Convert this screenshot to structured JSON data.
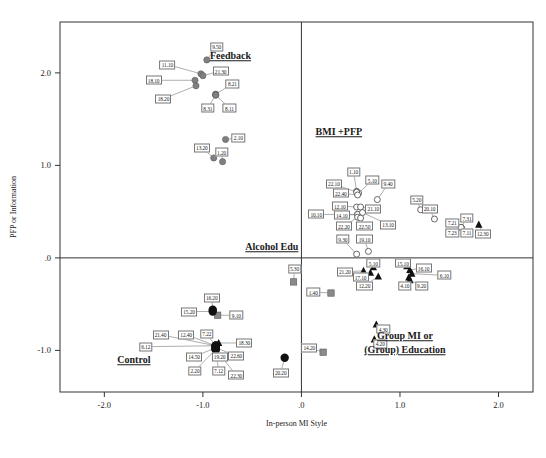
{
  "chart_data": {
    "type": "scatter",
    "title": "",
    "xlabel": "In-person MI Style",
    "ylabel": "PFP or Information",
    "xlim": [
      -2.45,
      2.35
    ],
    "ylim": [
      -1.45,
      2.55
    ],
    "xticks": [
      "-2.0",
      "-1.0",
      ".0",
      "1.0",
      "2.0"
    ],
    "xtickvals": [
      -2.0,
      -1.0,
      0.0,
      1.0,
      2.0
    ],
    "yticks": [
      "2.0",
      "1.0",
      ".0",
      "-1.0"
    ],
    "ytickvals": [
      2.0,
      1.0,
      0.0,
      -1.0
    ],
    "grid": false,
    "legend": "none",
    "reference_lines": {
      "vertical_x": 0.0,
      "horizontal_y": 0.0
    },
    "group_annotations": [
      {
        "text": "Feedback",
        "x": -0.72,
        "y": 2.18
      },
      {
        "text": "BMI +PFP",
        "x": 0.38,
        "y": 1.36
      },
      {
        "text": "Alcohol Edu",
        "x": -0.3,
        "y": 0.12
      },
      {
        "text": "Control",
        "x": -1.7,
        "y": -1.1
      },
      {
        "text": "Group MI or",
        "x": 1.05,
        "y": -0.84
      },
      {
        "text": "(Group) Education",
        "x": 1.05,
        "y": -1.0
      }
    ],
    "series": [
      {
        "name": "Feedback",
        "marker": "filled-circle-gray",
        "color": "#808080",
        "points": [
          {
            "label": "9.50",
            "x": -0.96,
            "y": 2.14,
            "lx": -0.86,
            "ly": 2.28
          },
          {
            "label": "11.10",
            "x": -1.02,
            "y": 1.99,
            "lx": -1.36,
            "ly": 2.09
          },
          {
            "label": "21.30",
            "x": -1.0,
            "y": 1.97,
            "lx": -0.82,
            "ly": 2.02
          },
          {
            "label": "18.10",
            "x": -1.08,
            "y": 1.92,
            "lx": -1.5,
            "ly": 1.92
          },
          {
            "label": "18.20",
            "x": -1.07,
            "y": 1.86,
            "lx": -1.4,
            "ly": 1.72
          },
          {
            "label": "8.21",
            "x": -0.87,
            "y": 1.77,
            "lx": -0.7,
            "ly": 1.88
          },
          {
            "label": "8.31",
            "x": -0.87,
            "y": 1.76,
            "lx": -0.95,
            "ly": 1.62
          },
          {
            "label": "8.11",
            "x": -0.87,
            "y": 1.76,
            "lx": -0.73,
            "ly": 1.62
          },
          {
            "label": "2.10",
            "x": -0.77,
            "y": 1.28,
            "lx": -0.64,
            "ly": 1.3
          },
          {
            "label": "13.20",
            "x": -0.89,
            "y": 1.08,
            "lx": -1.01,
            "ly": 1.19
          },
          {
            "label": "1.20",
            "x": -0.8,
            "y": 1.04,
            "lx": -0.81,
            "ly": 1.14
          }
        ]
      },
      {
        "name": "BMI +PFP",
        "marker": "open-circle",
        "color": "#555555",
        "points": [
          {
            "label": "1.10",
            "x": 0.56,
            "y": 0.72,
            "lx": 0.53,
            "ly": 0.93
          },
          {
            "label": "5.10",
            "x": 0.58,
            "y": 0.7,
            "lx": 0.72,
            "ly": 0.84
          },
          {
            "label": "9.40",
            "x": 0.77,
            "y": 0.63,
            "lx": 0.88,
            "ly": 0.8
          },
          {
            "label": "22.10",
            "x": 0.56,
            "y": 0.71,
            "lx": 0.33,
            "ly": 0.8
          },
          {
            "label": "22.40",
            "x": 0.57,
            "y": 0.68,
            "lx": 0.4,
            "ly": 0.7
          },
          {
            "label": "5.20",
            "x": 1.21,
            "y": 0.52,
            "lx": 1.17,
            "ly": 0.63
          },
          {
            "label": "12.10",
            "x": 0.56,
            "y": 0.55,
            "lx": 0.39,
            "ly": 0.56
          },
          {
            "label": "21.10",
            "x": 0.6,
            "y": 0.55,
            "lx": 0.73,
            "ly": 0.53
          },
          {
            "label": "20.10",
            "x": 1.35,
            "y": 0.42,
            "lx": 1.3,
            "ly": 0.53
          },
          {
            "label": "14.10",
            "x": 0.57,
            "y": 0.47,
            "lx": 0.41,
            "ly": 0.46
          },
          {
            "label": "10.10",
            "x": 0.57,
            "y": 0.47,
            "lx": 0.15,
            "ly": 0.47
          },
          {
            "label": "13.10",
            "x": 0.62,
            "y": 0.49,
            "lx": 0.88,
            "ly": 0.36
          },
          {
            "label": "22.20",
            "x": 0.57,
            "y": 0.44,
            "lx": 0.43,
            "ly": 0.34
          },
          {
            "label": "22.50",
            "x": 0.6,
            "y": 0.43,
            "lx": 0.64,
            "ly": 0.34
          },
          {
            "label": "7.31",
            "x": 1.62,
            "y": 0.33,
            "lx": 1.68,
            "ly": 0.43
          },
          {
            "label": "7.21",
            "x": 1.62,
            "y": 0.33,
            "lx": 1.53,
            "ly": 0.38
          },
          {
            "label": "7.23",
            "x": 1.62,
            "y": 0.33,
            "lx": 1.53,
            "ly": 0.27
          },
          {
            "label": "7.11",
            "x": 1.62,
            "y": 0.33,
            "lx": 1.68,
            "ly": 0.27
          },
          {
            "label": "9.30",
            "x": 0.56,
            "y": 0.04,
            "lx": 0.42,
            "ly": 0.2
          },
          {
            "label": "19.10",
            "x": 0.68,
            "y": 0.07,
            "lx": 0.64,
            "ly": 0.2
          }
        ]
      },
      {
        "name": "Group MI or (Group) Education",
        "marker": "filled-triangle",
        "color": "#111111",
        "points": [
          {
            "label": "12.30",
            "x": 1.8,
            "y": 0.36,
            "lx": 1.84,
            "ly": 0.26
          },
          {
            "label": "5.10b",
            "display": "5.10",
            "x": 0.73,
            "y": -0.1,
            "lx": 0.73,
            "ly": -0.06
          },
          {
            "label": "21.20",
            "x": 0.63,
            "y": -0.14,
            "lx": 0.44,
            "ly": -0.15
          },
          {
            "label": "17.10",
            "x": 0.7,
            "y": -0.16,
            "lx": 0.6,
            "ly": -0.21
          },
          {
            "label": "12.20",
            "x": 0.78,
            "y": -0.2,
            "lx": 0.64,
            "ly": -0.3
          },
          {
            "label": "15.10",
            "x": 1.07,
            "y": -0.09,
            "lx": 1.03,
            "ly": -0.06
          },
          {
            "label": "16.10",
            "x": 1.1,
            "y": -0.13,
            "lx": 1.24,
            "ly": -0.11
          },
          {
            "label": "6.10",
            "x": 1.12,
            "y": -0.17,
            "lx": 1.45,
            "ly": -0.19
          },
          {
            "label": "4.10",
            "x": 1.09,
            "y": -0.21,
            "lx": 1.05,
            "ly": -0.3
          },
          {
            "label": "9.20",
            "x": 1.1,
            "y": -0.24,
            "lx": 1.22,
            "ly": -0.3
          },
          {
            "label": "4.30",
            "x": 0.76,
            "y": -0.72,
            "lx": 0.83,
            "ly": -0.77
          },
          {
            "label": "4.20",
            "x": 0.74,
            "y": -0.88,
            "lx": 0.8,
            "ly": -0.93
          },
          {
            "label": "18.30",
            "x": -0.84,
            "y": -0.92,
            "lx": -0.58,
            "ly": -0.92
          }
        ]
      },
      {
        "name": "Alcohol Edu",
        "marker": "filled-square-gray",
        "color": "#8a8a8a",
        "points": [
          {
            "label": "5.30",
            "x": -0.08,
            "y": -0.26,
            "lx": -0.07,
            "ly": -0.12
          },
          {
            "label": "1.40",
            "x": 0.3,
            "y": -0.38,
            "lx": 0.12,
            "ly": -0.37
          },
          {
            "label": "9.10",
            "x": -0.85,
            "y": -0.62,
            "lx": -0.66,
            "ly": -0.62
          },
          {
            "label": "14.20",
            "x": 0.22,
            "y": -1.02,
            "lx": 0.08,
            "ly": -0.97
          }
        ]
      },
      {
        "name": "Control",
        "marker": "filled-circle-black",
        "color": "#111111",
        "points": [
          {
            "label": "16.20",
            "x": -0.9,
            "y": -0.56,
            "lx": -0.91,
            "ly": -0.43
          },
          {
            "label": "15.20",
            "x": -0.9,
            "y": -0.58,
            "lx": -1.14,
            "ly": -0.58
          },
          {
            "label": "7.22",
            "x": -0.87,
            "y": -0.95,
            "lx": -0.96,
            "ly": -0.82
          },
          {
            "label": "21.40",
            "x": -0.87,
            "y": -0.95,
            "lx": -1.43,
            "ly": -0.83
          },
          {
            "label": "12.40",
            "x": -0.87,
            "y": -0.95,
            "lx": -1.17,
            "ly": -0.83
          },
          {
            "label": "6.12",
            "x": -0.87,
            "y": -0.95,
            "lx": -1.58,
            "ly": -0.96
          },
          {
            "label": "14.50",
            "x": -0.87,
            "y": -0.97,
            "lx": -1.09,
            "ly": -1.07
          },
          {
            "label": "19.20",
            "x": -0.87,
            "y": -0.97,
            "lx": -0.83,
            "ly": -1.07
          },
          {
            "label": "22.60",
            "x": -0.87,
            "y": -0.97,
            "lx": -0.66,
            "ly": -1.06
          },
          {
            "label": "2.20",
            "x": -0.87,
            "y": -0.99,
            "lx": -1.08,
            "ly": -1.22
          },
          {
            "label": "7.12",
            "x": -0.87,
            "y": -0.99,
            "lx": -0.84,
            "ly": -1.22
          },
          {
            "label": "22.30",
            "x": -0.87,
            "y": -0.99,
            "lx": -0.66,
            "ly": -1.27
          },
          {
            "label": "20.20",
            "x": -0.17,
            "y": -1.08,
            "lx": -0.21,
            "ly": -1.24
          }
        ]
      }
    ]
  }
}
